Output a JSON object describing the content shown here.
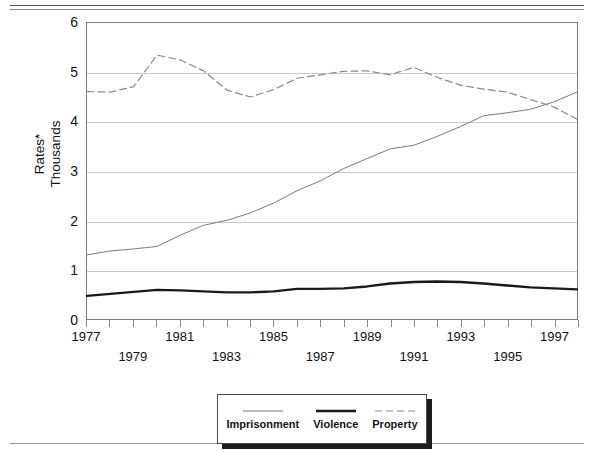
{
  "figure": {
    "y_axis_title_line1": "Rates*",
    "y_axis_title_line2": "Thousands"
  },
  "legend": {
    "items": [
      {
        "label": "Imprisonment",
        "style": "thin-solid",
        "color": "#7a7a7a"
      },
      {
        "label": "Violence",
        "style": "thick-solid",
        "color": "#1a1a1a"
      },
      {
        "label": "Property",
        "style": "dashed",
        "color": "#8a8a8a"
      }
    ]
  },
  "chart_data": {
    "type": "line",
    "title": "",
    "xlabel": "",
    "ylabel": "Rates* Thousands",
    "xlim": [
      1977,
      1998
    ],
    "ylim": [
      0,
      6
    ],
    "yticks": [
      0,
      1,
      2,
      3,
      4,
      5,
      6
    ],
    "grid": true,
    "legend_position": "bottom",
    "x": [
      1977,
      1978,
      1979,
      1980,
      1981,
      1982,
      1983,
      1984,
      1985,
      1986,
      1987,
      1988,
      1989,
      1990,
      1991,
      1992,
      1993,
      1994,
      1995,
      1996,
      1997,
      1998
    ],
    "xticklabels": [
      "1977",
      "1978",
      "1979",
      "1980",
      "1981",
      "1982",
      "1983",
      "1984",
      "1985",
      "1986",
      "1987",
      "1988",
      "1989",
      "1990",
      "1991",
      "1992",
      "1993",
      "1994",
      "1995",
      "1996",
      "1997",
      "1998"
    ],
    "xticklabels_shown": [
      "1977",
      "1979",
      "1981",
      "1983",
      "1985",
      "1987",
      "1989",
      "1991",
      "1993",
      "1995",
      "1997"
    ],
    "series": [
      {
        "name": "Imprisonment",
        "style": "thin-solid",
        "color": "#7a7a7a",
        "values": [
          1.3,
          1.38,
          1.42,
          1.47,
          1.7,
          1.9,
          2.0,
          2.15,
          2.35,
          2.6,
          2.8,
          3.05,
          3.25,
          3.45,
          3.52,
          3.7,
          3.9,
          4.12,
          4.18,
          4.25,
          4.4,
          4.6
        ]
      },
      {
        "name": "Violence",
        "style": "thick-solid",
        "color": "#1a1a1a",
        "values": [
          0.47,
          0.51,
          0.55,
          0.59,
          0.58,
          0.56,
          0.54,
          0.54,
          0.56,
          0.61,
          0.61,
          0.62,
          0.66,
          0.72,
          0.75,
          0.76,
          0.75,
          0.72,
          0.68,
          0.64,
          0.62,
          0.6
        ]
      },
      {
        "name": "Property",
        "style": "dashed",
        "color": "#8a8a8a",
        "values": [
          4.61,
          4.6,
          4.71,
          5.35,
          5.25,
          5.03,
          4.64,
          4.5,
          4.65,
          4.88,
          4.95,
          5.02,
          5.03,
          4.95,
          5.1,
          4.9,
          4.74,
          4.66,
          4.6,
          4.45,
          4.3,
          4.05
        ]
      }
    ]
  }
}
